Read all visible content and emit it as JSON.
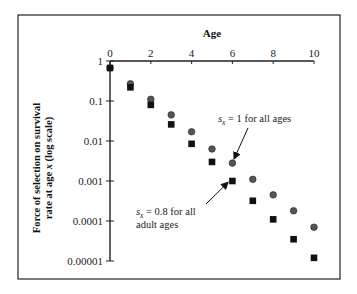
{
  "chart_data": {
    "type": "scatter",
    "title": "",
    "xlabel": "Age",
    "ylabel_line1": "Force of selection on survival",
    "ylabel_line2_prefix": "rate at age ",
    "ylabel_line2_var": "x",
    "ylabel_line2_suffix": " (log scale)",
    "ylabel": "Force of selection on survival rate at age x (log scale)",
    "x_axis_position": "top",
    "xlim": [
      0,
      10
    ],
    "ylim": [
      1e-05,
      1
    ],
    "yscale": "log",
    "grid": false,
    "x_ticks": [
      0,
      2,
      4,
      6,
      8,
      10
    ],
    "x_tick_labels": [
      "0",
      "2",
      "4",
      "6",
      "8",
      "10"
    ],
    "y_ticks": [
      1,
      0.1,
      0.01,
      0.001,
      0.0001,
      1e-05
    ],
    "y_tick_labels": [
      "1",
      "0.1",
      "0.01",
      "0.001",
      "0.0001",
      "0.00001"
    ],
    "x": [
      0,
      1,
      2,
      3,
      4,
      5,
      6,
      7,
      8,
      9,
      10
    ],
    "series": [
      {
        "name": "s_x = 1 for all ages",
        "marker": "circle",
        "color": "#555555",
        "values": [
          0.67,
          0.27,
          0.11,
          0.045,
          0.017,
          0.0063,
          0.0028,
          0.0011,
          0.00045,
          0.00018,
          7e-05
        ]
      },
      {
        "name": "s_x = 0.8 for all adult ages",
        "marker": "square",
        "color": "#111111",
        "values": [
          0.67,
          0.22,
          0.08,
          0.026,
          0.0085,
          0.003,
          0.001,
          0.00032,
          0.00011,
          3.5e-05,
          1.2e-05
        ]
      }
    ],
    "annotations": [
      {
        "series": 0,
        "var": "s",
        "sub": "x",
        "text_rest": " = 1 for all ages",
        "lines": [
          "s_x = 1 for all ages"
        ],
        "arrow_to_x": 6
      },
      {
        "series": 1,
        "var": "s",
        "sub": "x",
        "text_rest": " = 0.8 for all",
        "line2": "adult ages",
        "lines": [
          "s_x = 0.8 for all",
          "adult ages"
        ],
        "arrow_to_x": 6
      }
    ],
    "legend": "none (inline annotations with arrows)"
  }
}
